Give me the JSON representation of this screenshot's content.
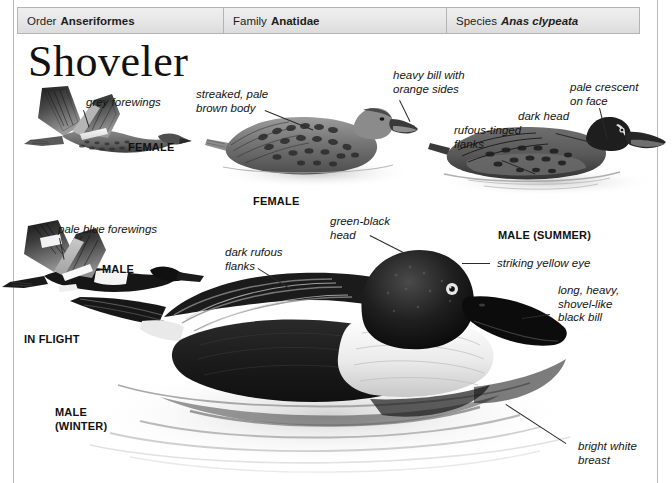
{
  "page": {
    "title": "Shoveler"
  },
  "taxonomy": {
    "order": {
      "key": "Order",
      "value": "Anseriformes"
    },
    "family": {
      "key": "Family",
      "value": "Anatidae"
    },
    "species": {
      "key": "Species",
      "value": "Anas clypeata"
    }
  },
  "annotations": [
    {
      "id": "grey-forewings",
      "text": "grey forewings"
    },
    {
      "id": "pale-blue-forewings",
      "text": "pale blue forewings"
    },
    {
      "id": "streaked-pale-brown-body",
      "text": "streaked, pale\nbrown body"
    },
    {
      "id": "heavy-bill-orange-sides",
      "text": "heavy bill with\norange sides"
    },
    {
      "id": "pale-crescent-on-face",
      "text": "pale crescent\non face"
    },
    {
      "id": "dark-head",
      "text": "dark head"
    },
    {
      "id": "rufous-tinged-flanks",
      "text": "rufous-tinged\nflanks"
    },
    {
      "id": "green-black-head",
      "text": "green-black\nhead"
    },
    {
      "id": "dark-rufous-flanks",
      "text": "dark rufous\nflanks"
    },
    {
      "id": "striking-yellow-eye",
      "text": "striking yellow eye"
    },
    {
      "id": "long-heavy-shovel-like-black-bill",
      "text": "long, heavy,\nshovel-like\nblack bill"
    },
    {
      "id": "bright-white-breast",
      "text": "bright white\nbreast"
    }
  ],
  "plate_labels": [
    {
      "id": "female-flight",
      "text": "FEMALE"
    },
    {
      "id": "male-flight",
      "text": "MALE"
    },
    {
      "id": "in-flight",
      "text": "IN FLIGHT"
    },
    {
      "id": "female-swimming",
      "text": "FEMALE"
    },
    {
      "id": "male-summer",
      "text": "MALE (SUMMER)"
    },
    {
      "id": "male-winter",
      "text": "MALE\n(WINTER)"
    }
  ],
  "colors": {
    "ink": "#141414",
    "rule": "#b9b9b9",
    "header_bg": "#e6e6e6",
    "header_border": "#b4b4b4"
  }
}
